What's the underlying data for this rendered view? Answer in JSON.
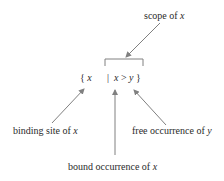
{
  "diagram": {
    "formula": {
      "open_brace": "{",
      "bound_var": "x",
      "separator": "|",
      "body_left": "x",
      "operator": ">",
      "body_right": "y",
      "close_brace": "}"
    },
    "labels": {
      "scope": {
        "text": "scope of ",
        "var": "x"
      },
      "binding_site": {
        "text": "binding site of ",
        "var": "x"
      },
      "bound_occurrence": {
        "text": "bound occurrence of ",
        "var": "x"
      },
      "free_occurrence": {
        "text": "free occurrence of ",
        "var": "y"
      }
    },
    "colors": {
      "text": "#2a2a2a",
      "arrow": "#808080"
    }
  }
}
